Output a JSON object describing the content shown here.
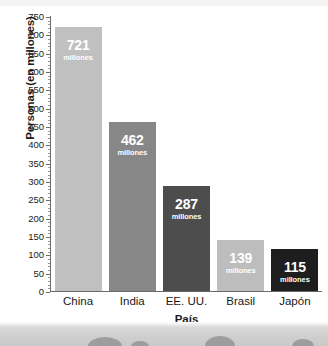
{
  "chart_data": {
    "type": "bar",
    "title": "",
    "xlabel": "País",
    "ylabel": "Personas (en millones)",
    "categories": [
      "China",
      "India",
      "EE. UU.",
      "Brasil",
      "Japón"
    ],
    "values": [
      721,
      462,
      287,
      139,
      115
    ],
    "value_unit": "millones",
    "ylim": [
      0,
      750
    ],
    "ytick_step": 50,
    "yticks": [
      "0",
      "50",
      "100",
      "150",
      "200",
      "250",
      "300",
      "350",
      "400",
      "450",
      "500",
      "550",
      "600",
      "650",
      "700",
      "750"
    ],
    "grid": false,
    "legend": "none",
    "bar_colors": [
      "#c0c0c0",
      "#878787",
      "#4d4d4d",
      "#bdbdbd",
      "#1e1e1e"
    ],
    "bar_label_color": "#ffffff",
    "axis_color": "#6a6a6a",
    "background": "#ffffff"
  }
}
